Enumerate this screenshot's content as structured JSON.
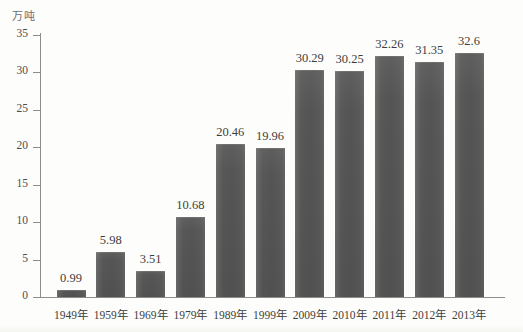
{
  "chart_data": {
    "type": "bar",
    "title": "",
    "subtitle": "",
    "xlabel": "",
    "ylabel": "万吨",
    "ylim": [
      0,
      35
    ],
    "ytick_step": 5,
    "yticks": [
      0,
      5,
      10,
      15,
      20,
      25,
      30,
      35
    ],
    "grid": false,
    "legend": false,
    "legend_position": "none",
    "bar_color": "#585858",
    "categories": [
      "1949年",
      "1959年",
      "1969年",
      "1979年",
      "1989年",
      "1999年",
      "2009年",
      "2010年",
      "2011年",
      "2012年",
      "2013年"
    ],
    "values": [
      0.99,
      5.98,
      3.51,
      10.68,
      20.46,
      19.96,
      30.29,
      30.25,
      32.26,
      31.35,
      32.6
    ],
    "value_labels": [
      "0.99",
      "5.98",
      "3.51",
      "10.68",
      "20.46",
      "19.96",
      "30.29",
      "30.25",
      "32.26",
      "31.35",
      "32.6"
    ],
    "ytick_labels": [
      "0",
      "5",
      "10",
      "15",
      "20",
      "25",
      "30",
      "35"
    ]
  },
  "axis": {
    "unit_label": "万吨"
  },
  "colors": {
    "background": "#fdfdfb",
    "axis_line": "#8c8c8c",
    "bar": "#585858",
    "text": "#3d3d3d"
  }
}
